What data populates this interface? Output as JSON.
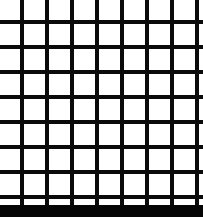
{
  "figure": {
    "kind": "grid-illusion-figure",
    "canvas": {
      "width": 203,
      "height": 217,
      "background_color": "#ffffff"
    },
    "grid": {
      "line_color": "#0a0a0a",
      "line_thickness_px": 4,
      "pitch_px": 25,
      "field_height_px": 205,
      "vertical_line_x": [
        22,
        47,
        72,
        97,
        122,
        147,
        172,
        197
      ],
      "horizontal_line_y": [
        22,
        47,
        72,
        97,
        122,
        147,
        172,
        197
      ],
      "vertical_line_count": 8,
      "horizontal_line_count": 8
    },
    "bottom_bar": {
      "color": "#050505",
      "height_px": 12,
      "artifact_text": ""
    }
  }
}
